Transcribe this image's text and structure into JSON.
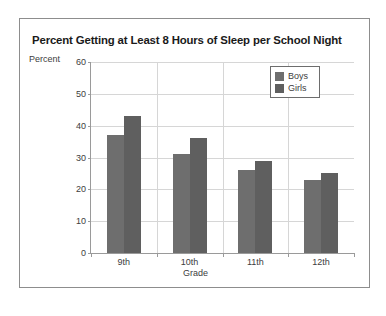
{
  "chart_data": {
    "type": "bar",
    "title": "Percent Getting at Least 8 Hours of Sleep per School Night",
    "xlabel": "Grade",
    "ylabel": "Percent",
    "categories": [
      "9th",
      "10th",
      "11th",
      "12th"
    ],
    "series": [
      {
        "name": "Boys",
        "color": "#6e6e6e",
        "values": [
          37,
          31,
          26,
          23
        ]
      },
      {
        "name": "Girls",
        "color": "#5f5f5f",
        "values": [
          43,
          36,
          29,
          25
        ]
      }
    ],
    "ylim": [
      0,
      60
    ],
    "ytick_values": [
      0,
      10,
      20,
      30,
      40,
      50,
      60
    ],
    "ytick_labels": [
      "0",
      "10",
      "20",
      "30",
      "40",
      "50",
      "60"
    ],
    "grid": true,
    "legend_position": "top-right"
  },
  "axes": {
    "y_caption": "Percent",
    "x_caption": "Grade"
  },
  "legend": {
    "entries": [
      {
        "label": "Boys"
      },
      {
        "label": "Girls"
      }
    ]
  }
}
